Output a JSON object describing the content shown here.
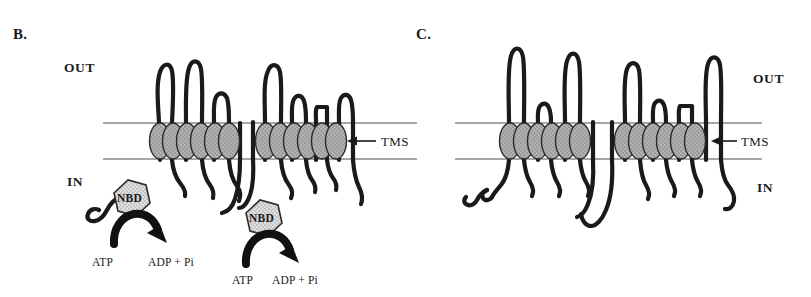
{
  "figure": {
    "type": "membrane-transporter-topology-diagram",
    "background_color": "#ffffff",
    "ink_color": "#1a1a1a",
    "membrane_line_color": "#8a8a8a",
    "tms_fill_color": "#9d9d9d",
    "nbd_fill_color": "#d9d9d9",
    "arrow_fill_color": "#111111"
  },
  "panels": [
    {
      "id": "panel-b",
      "letter": "B.",
      "out_label": "OUT",
      "in_label": "IN",
      "tms_label": "TMS",
      "tms_count": 12,
      "tms_groups": [
        6,
        6
      ],
      "nbd_count": 2,
      "nbd_label": "NBD",
      "nucleotides": [
        {
          "substrate": "ATP",
          "products": "ADP + Pi"
        },
        {
          "substrate": "ATP",
          "products": "ADP + Pi"
        }
      ]
    },
    {
      "id": "panel-c",
      "letter": "C.",
      "out_label": "OUT",
      "in_label": "IN",
      "tms_label": "TMS",
      "tms_count": 12,
      "tms_groups": [
        6,
        6
      ],
      "nbd_count": 0,
      "nbd_label": "",
      "nucleotides": []
    }
  ]
}
